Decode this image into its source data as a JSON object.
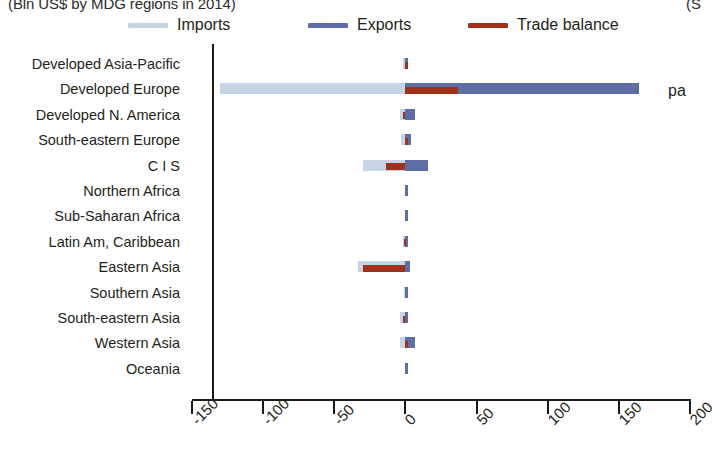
{
  "title": {
    "left": "(Bln US$ by MDG regions in 2014)",
    "right": "(S"
  },
  "side_note": "pa",
  "legend": {
    "position": "top",
    "items": [
      {
        "label": "Imports",
        "color": "#c5d5e6",
        "x": 0
      },
      {
        "label": "Exports",
        "color": "#5d6ea5",
        "x": 180
      },
      {
        "label": "Trade balance",
        "color": "#a03018",
        "x": 340
      }
    ]
  },
  "axis": {
    "ticks": [
      "-150",
      "-100",
      "-50",
      "0",
      "50",
      "100",
      "150",
      "200"
    ],
    "min": -150,
    "max": 200,
    "zero": 0
  },
  "chart_data": {
    "type": "bar",
    "orientation": "horizontal",
    "title": "(Bln US$ by MDG regions in 2014)",
    "xlabel": "",
    "ylabel": "",
    "xlim": [
      -150,
      200
    ],
    "grid": false,
    "legend_position": "top",
    "categories": [
      "Developed Asia-Pacific",
      "Developed Europe",
      "Developed N. America",
      "South-eastern Europe",
      "C I S",
      "Northern Africa",
      "Sub-Saharan Africa",
      "Latin Am, Caribbean",
      "Eastern Asia",
      "Southern Asia",
      "South-eastern Asia",
      "Western Asia",
      "Oceania"
    ],
    "series": [
      {
        "name": "Imports",
        "color": "#c5d5e6",
        "values": [
          -2,
          -130,
          -4,
          -3,
          -30,
          -0.5,
          -0.5,
          -2,
          -33,
          -1,
          -4,
          -4,
          -0.3
        ]
      },
      {
        "name": "Exports",
        "color": "#5d6ea5",
        "values": [
          2,
          164,
          7,
          4,
          16,
          0.5,
          0.5,
          2,
          3,
          1,
          2,
          7,
          0.3
        ]
      },
      {
        "name": "Trade balance",
        "color": "#a03018",
        "values": [
          1,
          37,
          -2,
          1,
          -14,
          0,
          0,
          -1,
          -30,
          0,
          -2,
          2,
          0
        ]
      }
    ]
  }
}
